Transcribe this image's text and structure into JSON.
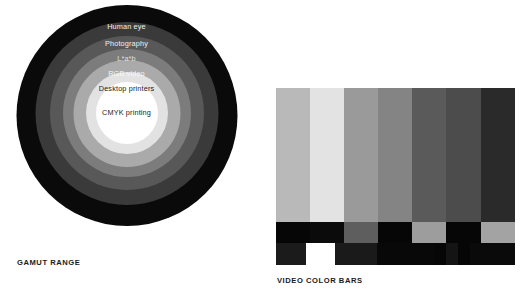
{
  "figures": {
    "gamut": {
      "caption": "GAMUT RANGE",
      "rings": [
        {
          "label": "Human eye",
          "color": "#0a0a0a",
          "text_color": "#f2f2f2",
          "size": 221,
          "top": 0,
          "label_top": 18
        },
        {
          "label": "Photography",
          "color": "#3a3a3a",
          "text_color": "#f2f2f2",
          "size": 183,
          "top": 17,
          "label_top": 35
        },
        {
          "label": "L*a*b",
          "color": "#585858",
          "text_color": "#dedede",
          "size": 154,
          "top": 31,
          "label_top": 50
        },
        {
          "label": "RGB video",
          "color": "#7c7c7c",
          "text_color": "#f5f5f5",
          "size": 128,
          "top": 44,
          "label_top": 65
        },
        {
          "label": "Desktop printers",
          "color": "#aaaaaa",
          "text_color": "#1c1c1c",
          "size": 107,
          "top": 55,
          "label_top": 80
        },
        {
          "label": "CMYK printing",
          "color": "#e2e2e2",
          "text_color": "#1c1c1c",
          "size": 82,
          "top": 67,
          "label_top": 104
        },
        {
          "label": "",
          "color": "#ffffff",
          "text_color": "#1c1c1c",
          "size": 62,
          "top": 77,
          "label_top": 0
        }
      ],
      "center_label": "CMYK printing",
      "center_label_top": 104
    },
    "color_bars": {
      "caption": "VIDEO COLOR BARS",
      "main_bars": [
        {
          "name": "gray",
          "color": "#b9b9b9",
          "width": 34
        },
        {
          "name": "yellow",
          "color": "#e3e3e3",
          "width": 34
        },
        {
          "name": "cyan",
          "color": "#9a9a9a",
          "width": 34
        },
        {
          "name": "green",
          "color": "#848484",
          "width": 34
        },
        {
          "name": "magenta",
          "color": "#5a5a5a",
          "width": 34
        },
        {
          "name": "red",
          "color": "#4c4c4c",
          "width": 35
        },
        {
          "name": "blue",
          "color": "#2a2a2a",
          "width": 34
        }
      ],
      "middle_bars": [
        {
          "name": "blue",
          "color": "#060606",
          "width": 34
        },
        {
          "name": "black",
          "color": "#0b0b0b",
          "width": 34
        },
        {
          "name": "magenta",
          "color": "#5e5e5e",
          "width": 34
        },
        {
          "name": "black",
          "color": "#060606",
          "width": 34
        },
        {
          "name": "cyan",
          "color": "#9d9d9d",
          "width": 34
        },
        {
          "name": "black",
          "color": "#060606",
          "width": 35
        },
        {
          "name": "light-gray",
          "color": "#a3a3a3",
          "width": 34
        }
      ],
      "bottom_bars": [
        {
          "name": "dark-blue",
          "color": "#1b1b1b",
          "width": 30
        },
        {
          "name": "white",
          "color": "#ffffff",
          "width": 29
        },
        {
          "name": "dark-purple",
          "color": "#1a1a1a",
          "width": 42
        },
        {
          "name": "black",
          "color": "#080808",
          "width": 57
        },
        {
          "name": "pluge-minus",
          "color": "#060606",
          "width": 12
        },
        {
          "name": "pluge-mid",
          "color": "#141414",
          "width": 12
        },
        {
          "name": "pluge-plus",
          "color": "#060606",
          "width": 12
        },
        {
          "name": "black-end",
          "color": "#0a0a0a",
          "width": 45
        }
      ]
    }
  }
}
